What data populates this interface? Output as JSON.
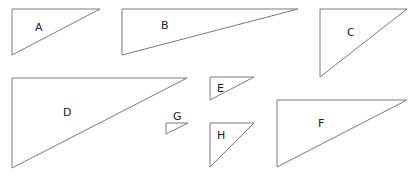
{
  "diagram": {
    "stroke_color": "#7a7a7a",
    "triangles": [
      {
        "label": "A",
        "points": "12,9 100,9 12,55",
        "label_x": 35,
        "label_y": 31
      },
      {
        "label": "B",
        "points": "122,9 298,9 122,55",
        "label_x": 161,
        "label_y": 29
      },
      {
        "label": "C",
        "points": "320,9 407,9 320,77",
        "label_x": 347,
        "label_y": 36
      },
      {
        "label": "D",
        "points": "12,78 187,78 12,168",
        "label_x": 63,
        "label_y": 116
      },
      {
        "label": "E",
        "points": "210,77 254,77 210,100",
        "label_x": 217,
        "label_y": 92
      },
      {
        "label": "F",
        "points": "277,100 407,100 277,167",
        "label_x": 318,
        "label_y": 127
      },
      {
        "label": "G",
        "points": "166,123 188,123 166,134",
        "label_x": 173,
        "label_y": 120
      },
      {
        "label": "H",
        "points": "210,123 254,123 210,167",
        "label_x": 217,
        "label_y": 139
      }
    ]
  }
}
